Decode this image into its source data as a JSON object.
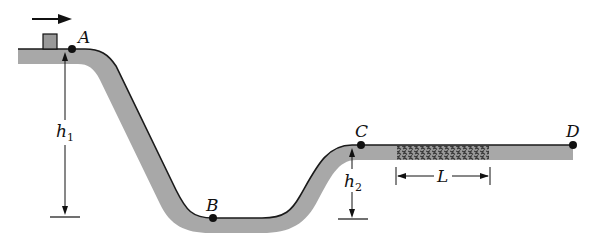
{
  "figure": {
    "colors": {
      "track_fill": "#a8a8a8",
      "track_edge": "#1a1a1a",
      "rough_patch": "#555555",
      "block_fill": "#999999",
      "ink": "#111111"
    },
    "motion_arrow": {
      "direction": "right"
    },
    "points": [
      {
        "id": "A",
        "label": "A"
      },
      {
        "id": "B",
        "label": "B"
      },
      {
        "id": "C",
        "label": "C"
      },
      {
        "id": "D",
        "label": "D"
      }
    ],
    "dimensions": {
      "h1": {
        "symbol": "h",
        "subscript": "1"
      },
      "h2": {
        "symbol": "h",
        "subscript": "2"
      },
      "L": {
        "symbol": "L"
      }
    }
  }
}
